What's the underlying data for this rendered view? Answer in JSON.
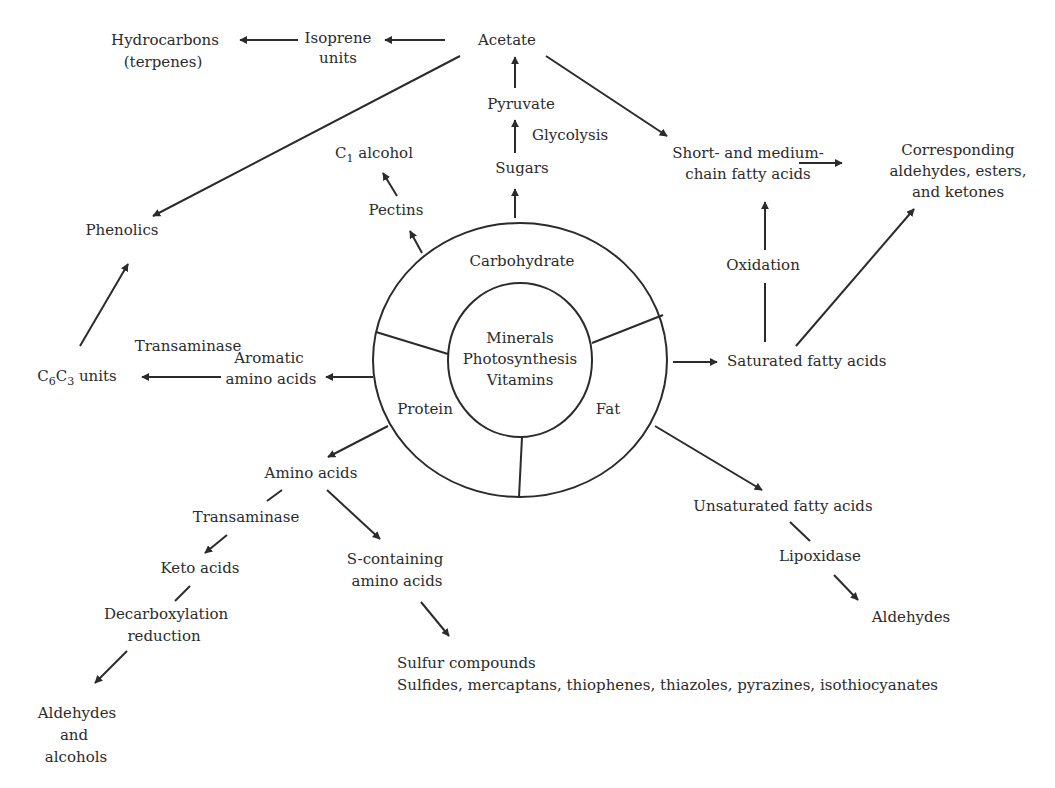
{
  "diagram": {
    "center": {
      "inner_lines": [
        "Minerals",
        "Photosynthesis",
        "Vitamins"
      ],
      "segments": {
        "carbohydrate": "Carbohydrate",
        "protein": "Protein",
        "fat": "Fat"
      }
    },
    "carbohydrate_branch": {
      "pectins": "Pectins",
      "c1_alcohol_prefix": "C",
      "c1_alcohol_sub": "1",
      "c1_alcohol_suffix": " alcohol",
      "sugars": "Sugars",
      "glycolysis": "Glycolysis",
      "pyruvate": "Pyruvate",
      "acetate": "Acetate",
      "isoprene_line1": "Isoprene",
      "isoprene_line2": "units",
      "hydrocarbons_line1": "Hydrocarbons",
      "hydrocarbons_line2": "(terpenes)",
      "phenolics": "Phenolics",
      "short_medium_line1": "Short- and medium-",
      "short_medium_line2": "chain fatty acids",
      "corresponding_line1": "Corresponding",
      "corresponding_line2": "aldehydes, esters,",
      "corresponding_line3": "and ketones"
    },
    "fat_branch": {
      "oxidation": "Oxidation",
      "saturated": "Saturated fatty acids",
      "unsaturated": "Unsaturated fatty acids",
      "lipoxidase": "Lipoxidase",
      "aldehydes": "Aldehydes"
    },
    "protein_branch": {
      "transaminase_top": "Transaminase",
      "aromatic_line1": "Aromatic",
      "aromatic_line2": "amino acids",
      "c6c3_c1": "C",
      "c6c3_sub1": "6",
      "c6c3_c2": "C",
      "c6c3_sub2": "3",
      "c6c3_suffix": " units",
      "amino_acids": "Amino acids",
      "transaminase_bottom": "Transaminase",
      "keto_acids": "Keto acids",
      "decarb_line1": "Decarboxylation",
      "decarb_line2": "reduction",
      "ald_alc_line1": "Aldehydes",
      "ald_alc_line2": "and",
      "ald_alc_line3": "alcohols",
      "s_containing_line1": "S-containing",
      "s_containing_line2": "amino acids",
      "sulfur_line1": "Sulfur compounds",
      "sulfur_line2": "Sulfides, mercaptans, thiophenes, thiazoles, pyrazines, isothiocyanates"
    },
    "colors": {
      "ink": "#2b2b2b",
      "background": "#ffffff"
    }
  }
}
